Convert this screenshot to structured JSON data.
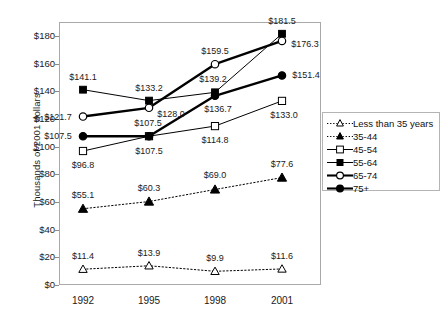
{
  "chart_data": {
    "type": "line",
    "title": "",
    "xlabel": "",
    "ylabel": "Thousands of 2001 dollars",
    "categories": [
      "1992",
      "1995",
      "1998",
      "2001"
    ],
    "ylim": [
      0,
      190
    ],
    "yticks": [
      0,
      20,
      40,
      60,
      80,
      100,
      120,
      140,
      160,
      180
    ],
    "ytick_labels": [
      "$0",
      "$20",
      "$40",
      "$60",
      "$80",
      "$100",
      "$120",
      "$140",
      "$160",
      "$180"
    ],
    "grid": false,
    "legend_position": "right",
    "series": [
      {
        "name": "Less than 35 years",
        "marker": "open-triangle",
        "line": "dotted",
        "weight": "thin",
        "values": [
          11.4,
          13.9,
          9.9,
          11.6
        ],
        "labels": [
          "$11.4",
          "$13.9",
          "$9.9",
          "$11.6"
        ]
      },
      {
        "name": "35-44",
        "marker": "filled-triangle",
        "line": "dotted",
        "weight": "thin",
        "values": [
          55.1,
          60.3,
          69.0,
          77.6
        ],
        "labels": [
          "$55.1",
          "$60.3",
          "$69.0",
          "$77.6"
        ]
      },
      {
        "name": "45-54",
        "marker": "open-square",
        "line": "solid",
        "weight": "thin",
        "values": [
          96.8,
          107.5,
          114.8,
          133.0
        ],
        "labels": [
          "$96.8",
          "$107.5",
          "$114.8",
          "$133.0"
        ]
      },
      {
        "name": "55-64",
        "marker": "filled-square",
        "line": "solid",
        "weight": "thin",
        "values": [
          141.1,
          133.2,
          139.2,
          181.5
        ],
        "labels": [
          "$141.1",
          "$133.2",
          "$139.2",
          "$181.5"
        ]
      },
      {
        "name": "65-74",
        "marker": "open-circle",
        "line": "solid",
        "weight": "bold",
        "values": [
          121.7,
          128.0,
          159.5,
          176.3
        ],
        "labels": [
          "$121.7",
          "$128.0",
          "$159.5",
          "$176.3"
        ]
      },
      {
        "name": "75+",
        "marker": "filled-circle",
        "line": "solid",
        "weight": "bold",
        "values": [
          107.5,
          107.5,
          136.7,
          151.4
        ],
        "labels": [
          "$107.5",
          "$107.5",
          "$136.7",
          "$151.4"
        ]
      }
    ],
    "colors": {
      "line": "#000000",
      "axis": "#a9a9a9",
      "text": "#1a1a1a",
      "background": "#ffffff"
    }
  },
  "legend": {
    "items": [
      {
        "label": "Less than 35 years"
      },
      {
        "label": "35-44"
      },
      {
        "label": "45-54"
      },
      {
        "label": "55-64"
      },
      {
        "label": "65-74"
      },
      {
        "label": "75+"
      }
    ]
  }
}
